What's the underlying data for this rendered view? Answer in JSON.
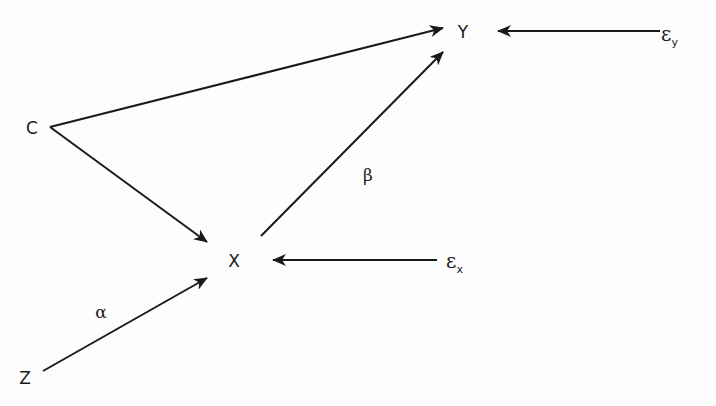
{
  "diagram": {
    "type": "causal-path-diagram",
    "nodes": {
      "C": {
        "label": "C",
        "x": 32,
        "y": 128
      },
      "Y": {
        "label": "Y",
        "x": 463,
        "y": 32
      },
      "X": {
        "label": "X",
        "x": 234,
        "y": 261
      },
      "Z": {
        "label": "Z",
        "x": 25,
        "y": 378
      },
      "eps_y": {
        "symbol": "ε",
        "subscript": "y",
        "x": 661,
        "y": 36
      },
      "eps_x": {
        "symbol": "ε",
        "subscript": "x",
        "x": 446,
        "y": 263
      }
    },
    "coefficients": {
      "alpha": {
        "label": "α",
        "x": 101,
        "y": 312
      },
      "beta": {
        "label": "β",
        "x": 368,
        "y": 175
      }
    },
    "edges": [
      {
        "from": "C",
        "to": "Y",
        "x1": 50,
        "y1": 127,
        "x2": 443,
        "y2": 28
      },
      {
        "from": "C",
        "to": "X",
        "x1": 50,
        "y1": 127,
        "x2": 207,
        "y2": 242
      },
      {
        "from": "X",
        "to": "Y",
        "x1": 261,
        "y1": 236,
        "x2": 443,
        "y2": 52,
        "coefficient": "β"
      },
      {
        "from": "Z",
        "to": "X",
        "x1": 43,
        "y1": 371,
        "x2": 207,
        "y2": 278,
        "coefficient": "α"
      },
      {
        "from": "eps_y",
        "to": "Y",
        "x1": 660,
        "y1": 31,
        "x2": 498,
        "y2": 31
      },
      {
        "from": "eps_x",
        "to": "X",
        "x1": 437,
        "y1": 260,
        "x2": 273,
        "y2": 260
      }
    ],
    "colors": {
      "stroke": "#1a1a1a",
      "background": "#fdfdfd"
    }
  }
}
